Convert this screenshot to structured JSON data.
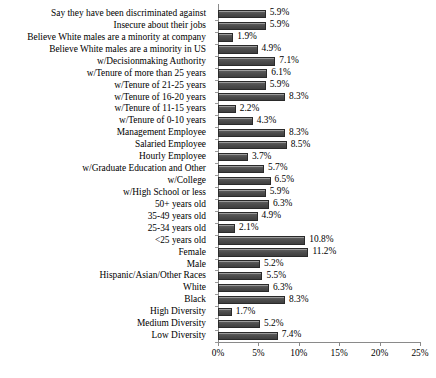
{
  "chart_data": {
    "type": "bar",
    "orientation": "horizontal",
    "title": "",
    "subtitle": "",
    "xlabel": "",
    "ylabel": "",
    "xlim": [
      0,
      25
    ],
    "xticks": [
      "0%",
      "5%",
      "10%",
      "15%",
      "20%",
      "25%"
    ],
    "xtick_values": [
      0,
      5,
      10,
      15,
      20,
      25
    ],
    "grid": false,
    "legend": null,
    "value_suffix": "%",
    "categories": [
      "Say they have been discriminated against",
      "Insecure about their jobs",
      "Believe White males are a minority at company",
      "Believe White males are a minority in US",
      "w/Decisionmaking Authority",
      "w/Tenure of more than 25 years",
      "w/Tenure of 21-25 years",
      "w/Tenure of 16-20 years",
      "w/Tenure of 11-15 years",
      "w/Tenure of 0-10 years",
      "Management Employee",
      "Salaried Employee",
      "Hourly Employee",
      "w/Graduate Education and Other",
      "w/College",
      "w/High School or less",
      "50+ years old",
      "35-49 years old",
      "25-34 years old",
      "<25 years old",
      "Female",
      "Male",
      "Hispanic/Asian/Other Races",
      "White",
      "Black",
      "High Diversity",
      "Medium Diversity",
      "Low Diversity"
    ],
    "values": [
      5.9,
      5.9,
      1.9,
      4.9,
      7.1,
      6.1,
      5.9,
      8.3,
      2.2,
      4.3,
      8.3,
      8.5,
      3.7,
      5.7,
      6.5,
      5.9,
      6.3,
      4.9,
      2.1,
      10.8,
      11.2,
      5.2,
      5.5,
      6.3,
      8.3,
      1.7,
      5.2,
      7.4
    ],
    "value_labels": [
      "5.9%",
      "5.9%",
      "1.9%",
      "4.9%",
      "7.1%",
      "6.1%",
      "5.9%",
      "8.3%",
      "2.2%",
      "4.3%",
      "8.3%",
      "8.5%",
      "3.7%",
      "5.7%",
      "6.5%",
      "5.9%",
      "6.3%",
      "4.9%",
      "2.1%",
      "10.8%",
      "11.2%",
      "5.2%",
      "5.5%",
      "6.3%",
      "8.3%",
      "1.7%",
      "5.2%",
      "7.4%"
    ],
    "colors": {
      "bar_fill": "#4b4b4b",
      "bar_edge": "#2a2a2a",
      "axis": "#8a8a8a",
      "text": "#000000",
      "background": "#ffffff"
    }
  }
}
